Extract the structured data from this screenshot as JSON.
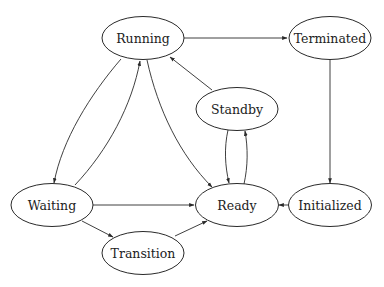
{
  "diagram": {
    "type": "state-diagram",
    "nodes": [
      {
        "id": "running",
        "label": "Running",
        "cx": 143,
        "cy": 38
      },
      {
        "id": "terminated",
        "label": "Terminated",
        "cx": 330,
        "cy": 38
      },
      {
        "id": "standby",
        "label": "Standby",
        "cx": 237,
        "cy": 109
      },
      {
        "id": "waiting",
        "label": "Waiting",
        "cx": 52,
        "cy": 205
      },
      {
        "id": "ready",
        "label": "Ready",
        "cx": 237,
        "cy": 205
      },
      {
        "id": "initialized",
        "label": "Initialized",
        "cx": 330,
        "cy": 205
      },
      {
        "id": "transition",
        "label": "Transition",
        "cx": 143,
        "cy": 253
      }
    ],
    "edges": [
      {
        "from": "Running",
        "to": "Terminated"
      },
      {
        "from": "Running",
        "to": "Waiting"
      },
      {
        "from": "Waiting",
        "to": "Running"
      },
      {
        "from": "Running",
        "to": "Ready"
      },
      {
        "from": "Standby",
        "to": "Running"
      },
      {
        "from": "Standby",
        "to": "Ready"
      },
      {
        "from": "Ready",
        "to": "Standby"
      },
      {
        "from": "Terminated",
        "to": "Initialized"
      },
      {
        "from": "Initialized",
        "to": "Ready"
      },
      {
        "from": "Waiting",
        "to": "Ready"
      },
      {
        "from": "Waiting",
        "to": "Transition"
      },
      {
        "from": "Transition",
        "to": "Ready"
      }
    ],
    "colors": {
      "stroke": "#2a2a2a",
      "fill": "#ffffff",
      "text": "#222222"
    }
  }
}
